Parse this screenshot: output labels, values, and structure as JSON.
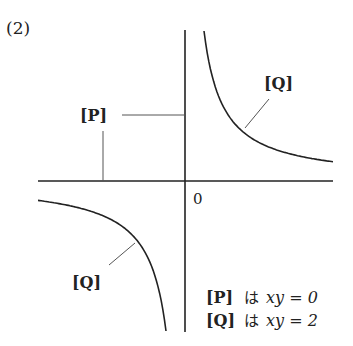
{
  "problem_number": "(2)",
  "origin_label": "0",
  "labels": {
    "p": "[P]",
    "q_upper": "[Q]",
    "q_lower": "[Q]"
  },
  "legend": [
    {
      "tag": "[P]",
      "particle": "は",
      "equation": "xy = 0"
    },
    {
      "tag": "[Q]",
      "particle": "は",
      "equation": "xy = 2"
    }
  ],
  "chart_data": {
    "type": "line",
    "title": "(2)",
    "xlabel": "",
    "ylabel": "",
    "origin_label": "0",
    "series": [
      {
        "name": "P",
        "equation": "xy = 0",
        "description": "the coordinate axes"
      },
      {
        "name": "Q",
        "equation": "xy = 2",
        "description": "rectangular hyperbola, branches in quadrants I and III"
      }
    ],
    "k": 2
  },
  "colors": {
    "ink": "#222222",
    "leader": "#555555"
  }
}
